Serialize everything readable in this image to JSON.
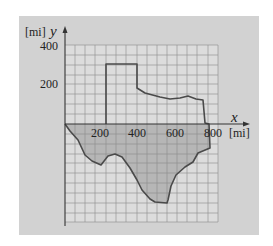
{
  "figure": {
    "y_axis_label": "y",
    "y_axis_unit": "[mi]",
    "x_axis_label": "x",
    "x_axis_unit": "[mi]",
    "y_ticks": [
      "400",
      "200"
    ],
    "x_ticks": [
      "200",
      "400",
      "600",
      "800"
    ],
    "grid_spacing_mi": 50,
    "shape": "Texas outline",
    "colors": {
      "panel": "#d2d2d2",
      "grid_bg": "#dcdcdc",
      "region_fill": "#b8b8b8",
      "grid_line": "#8c8c8c",
      "boundary": "#4a4a4a"
    }
  }
}
